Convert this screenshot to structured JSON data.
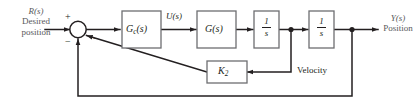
{
  "diagram": {
    "colors": {
      "line": "#231f20",
      "block_stroke": "#6d6e71",
      "block_fill": "#ffffff",
      "io_text": "#58595b",
      "label_text": "#231f20",
      "background": "#ffffff"
    },
    "input": {
      "symbol": "R(s)",
      "line1": "Desired",
      "line2": "position"
    },
    "output": {
      "symbol": "Y(s)",
      "line1": "Position"
    },
    "summing_junction": {
      "name": "summing-junction",
      "signs": [
        "+",
        "−",
        "−"
      ]
    },
    "blocks": [
      {
        "id": "controller",
        "label": "G_c(s)",
        "display": "Gc(s)"
      },
      {
        "id": "plant",
        "label": "G(s)",
        "display": "G(s)"
      },
      {
        "id": "integrator-1",
        "label": "1/s",
        "numerator": "1",
        "denominator": "s"
      },
      {
        "id": "integrator-2",
        "label": "1/s",
        "numerator": "1",
        "denominator": "s"
      },
      {
        "id": "velocity-gain",
        "label": "K_2",
        "display": "K2"
      }
    ],
    "signals": [
      {
        "id": "control-signal",
        "label": "U(s)"
      },
      {
        "id": "velocity-signal",
        "label": "Velocity"
      }
    ],
    "feedback": {
      "inner_label": "Velocity",
      "inner_gain": "K2",
      "outer_label": ""
    }
  }
}
